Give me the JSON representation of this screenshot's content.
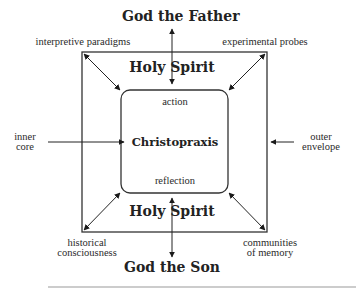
{
  "diagram": {
    "top_label": "God the Father",
    "bottom_label": "God the Son",
    "top_spirit": "Holy Spirit",
    "bottom_spirit": "Holy Spirit",
    "center": "Christopraxis",
    "inner_top": "action",
    "inner_bottom": "reflection",
    "corners": {
      "top_left": "interpretive paradigms",
      "top_right": "experimental probes",
      "bottom_left_line1": "historical",
      "bottom_left_line2": "consciousness",
      "bottom_right_line1": "communities",
      "bottom_right_line2": "of memory"
    },
    "left_line1": "inner",
    "left_line2": "core",
    "right_line1": "outer",
    "right_line2": "envelope"
  }
}
